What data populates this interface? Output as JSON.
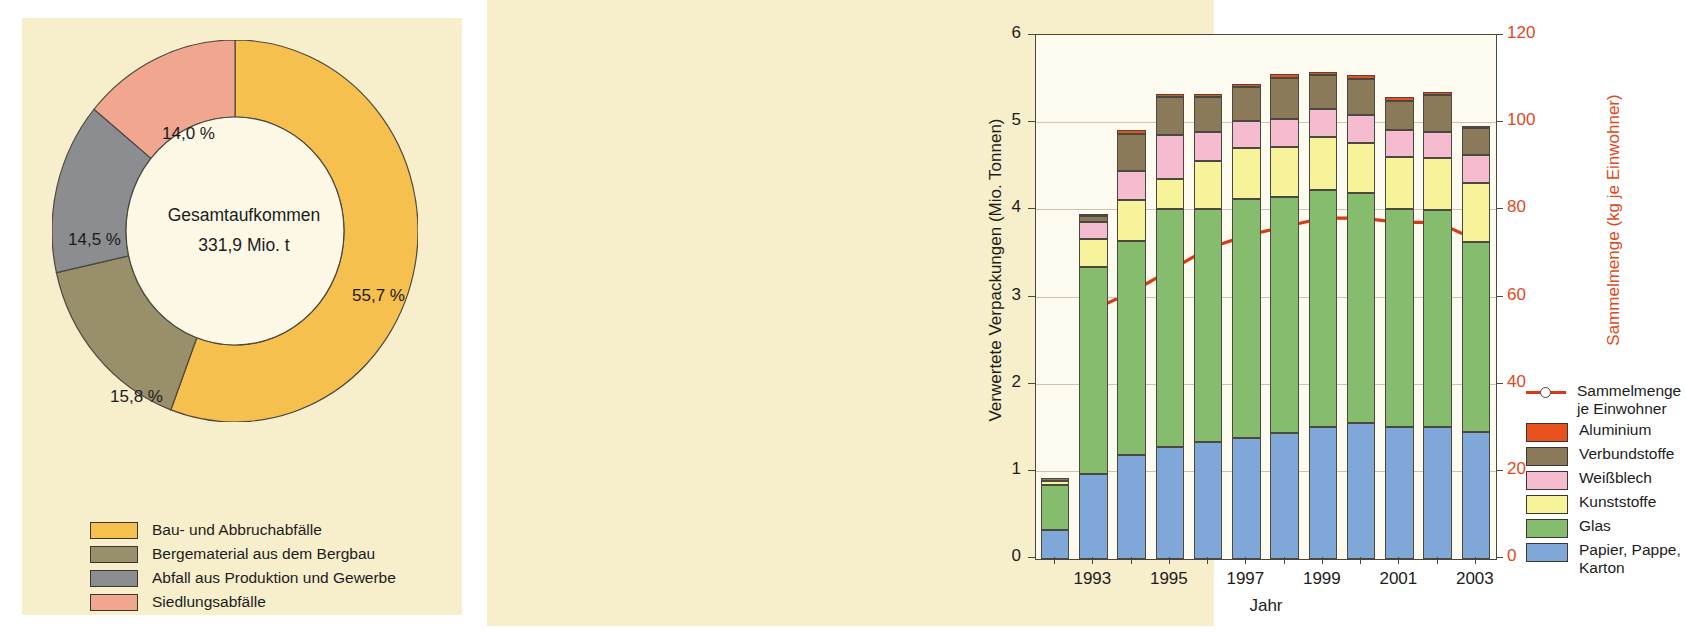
{
  "colors": {
    "page_bg": "#f7eecb",
    "plot_bg": "#fdfbef",
    "axis": "#4b4840",
    "grid": "#c9c7b4",
    "line": "#d83a14",
    "right_axis_text": "#e2481b",
    "donut_bau": "#f5c04e",
    "donut_berg": "#9a8f6b",
    "donut_abfall": "#8b8d90",
    "donut_siedl": "#f1a78f",
    "donut_hole": "#fdf8e6",
    "donut_shadow": "#5d5a52",
    "bar_aluminium": "#e8501e",
    "bar_verbund": "#8a7a5a",
    "bar_weissblech": "#f5bbcf",
    "bar_kunststoffe": "#f7f39a",
    "bar_glas": "#86bc6e",
    "bar_papier": "#7fa8d8"
  },
  "donut_chart": {
    "type": "pie",
    "title": "",
    "center_label_line1": "Gesamtaufkommen",
    "center_label_line2": "331,9 Mio. t",
    "total_value": 331.9,
    "total_unit": "Mio. t",
    "categories": [
      "Bau- und Abbruchabfälle",
      "Bergematerial aus dem Bergbau",
      "Abfall aus Produktion und Gewerbe",
      "Siedlungsabfälle"
    ],
    "values": [
      55.7,
      15.8,
      14.5,
      14.0
    ],
    "value_labels": [
      "55,7 %",
      "15,8 %",
      "14,5 %",
      "14,0 %"
    ],
    "legend_position": "bottom",
    "legend": [
      {
        "label": "Bau- und Abbruchabfälle",
        "color": "#f5c04e"
      },
      {
        "label": "Bergematerial aus dem Bergbau",
        "color": "#9a8f6b"
      },
      {
        "label": "Abfall aus Produktion und Gewerbe",
        "color": "#8b8d90"
      },
      {
        "label": "Siedlungsabfälle",
        "color": "#f1a78f"
      }
    ]
  },
  "chart_data": {
    "type": "bar",
    "title": "",
    "xlabel": "Jahr",
    "ylabel": "Verwertete Verpackungen (Mio. Tonnen)",
    "ylabel_right": "Sammelmenge (kg je Einwohner)",
    "ylim": [
      0,
      6
    ],
    "ylim_right": [
      0,
      120
    ],
    "yticks": [
      0,
      1,
      2,
      3,
      4,
      5,
      6
    ],
    "yticks_right": [
      0,
      20,
      40,
      60,
      80,
      100,
      120
    ],
    "grid": true,
    "legend_position": "right",
    "categories": [
      1992,
      1993,
      1994,
      1995,
      1996,
      1997,
      1998,
      1999,
      2000,
      2001,
      2002,
      2003
    ],
    "xtick_labels": [
      "",
      "1993",
      "",
      "1995",
      "",
      "1997",
      "",
      "1999",
      "",
      "2001",
      "",
      "2003"
    ],
    "series": [
      {
        "name": "Papier, Pappe, Karton",
        "color": "#7fa8d8",
        "values": [
          0.33,
          0.97,
          1.19,
          1.28,
          1.34,
          1.39,
          1.44,
          1.52,
          1.56,
          1.52,
          1.51,
          1.46
        ]
      },
      {
        "name": "Glas",
        "color": "#86bc6e",
        "values": [
          0.52,
          2.38,
          2.46,
          2.73,
          2.68,
          2.74,
          2.71,
          2.71,
          2.64,
          2.5,
          2.49,
          2.18
        ]
      },
      {
        "name": "Kunststoffe",
        "color": "#f7f39a",
        "values": [
          0.05,
          0.32,
          0.47,
          0.35,
          0.55,
          0.59,
          0.58,
          0.61,
          0.57,
          0.59,
          0.6,
          0.67
        ]
      },
      {
        "name": "Weißblech",
        "color": "#f5bbcf",
        "values": [
          0.0,
          0.2,
          0.33,
          0.51,
          0.33,
          0.31,
          0.32,
          0.32,
          0.32,
          0.31,
          0.3,
          0.32
        ]
      },
      {
        "name": "Verbundstoffe",
        "color": "#8a7a5a",
        "values": [
          0.03,
          0.06,
          0.43,
          0.43,
          0.4,
          0.38,
          0.47,
          0.39,
          0.42,
          0.34,
          0.42,
          0.31
        ]
      },
      {
        "name": "Aluminium",
        "color": "#e8501e",
        "values": [
          0.0,
          0.02,
          0.04,
          0.04,
          0.04,
          0.04,
          0.04,
          0.04,
          0.04,
          0.04,
          0.04,
          0.03
        ]
      }
    ],
    "line_series": {
      "name": "Sammelmenge je Einwohner",
      "color": "#d83a14",
      "axis": "right",
      "unit": "kg je Einwohner",
      "x": [
        1993,
        1994,
        1995,
        1996,
        1997,
        1998,
        1999,
        2000,
        2001,
        2002,
        2003
      ],
      "values": [
        57,
        61,
        66,
        71,
        74,
        76,
        78,
        78,
        77,
        77,
        73
      ]
    },
    "legend": [
      {
        "label_line1": "Sammelmenge",
        "label_line2": "je Einwohner",
        "type": "line",
        "color": "#d83a14"
      },
      {
        "label_line1": "Aluminium",
        "label_line2": "",
        "type": "swatch",
        "color": "#e8501e"
      },
      {
        "label_line1": "Verbundstoffe",
        "label_line2": "",
        "type": "swatch",
        "color": "#8a7a5a"
      },
      {
        "label_line1": "Weißblech",
        "label_line2": "",
        "type": "swatch",
        "color": "#f5bbcf"
      },
      {
        "label_line1": "Kunststoffe",
        "label_line2": "",
        "type": "swatch",
        "color": "#f7f39a"
      },
      {
        "label_line1": "Glas",
        "label_line2": "",
        "type": "swatch",
        "color": "#86bc6e"
      },
      {
        "label_line1": "Papier, Pappe,",
        "label_line2": "Karton",
        "type": "swatch",
        "color": "#7fa8d8"
      }
    ]
  }
}
